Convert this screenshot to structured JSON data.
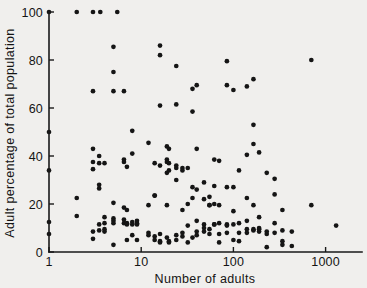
{
  "figure": {
    "background_color": "#f0efed",
    "ink_color": "#151515"
  },
  "axes": {
    "x_title": "Number of adults",
    "y_title": "Adult percentage of total population",
    "x_ticks": [
      "1",
      "10",
      "100",
      "1000"
    ],
    "y_ticks": [
      "0",
      "20",
      "40",
      "60",
      "80",
      "100"
    ]
  },
  "chart_data": {
    "type": "scatter",
    "title": "",
    "xlabel": "Number of adults",
    "ylabel": "Adult percentage of total population",
    "xscale": "log",
    "yscale": "linear",
    "xlim": [
      1,
      2200
    ],
    "ylim": [
      0,
      100
    ],
    "xticks": [
      1,
      10,
      100,
      1000
    ],
    "yticks": [
      0,
      20,
      40,
      60,
      80,
      100
    ],
    "grid": false,
    "legend": null,
    "marker": "filled-circle",
    "marker_color": "#151515",
    "points": [
      [
        1,
        100
      ],
      [
        2,
        100
      ],
      [
        3,
        100
      ],
      [
        3.6,
        100
      ],
      [
        5.5,
        100
      ],
      [
        1,
        50
      ],
      [
        1,
        34
      ],
      [
        1,
        12.5
      ],
      [
        1,
        7.5
      ],
      [
        2,
        22.5
      ],
      [
        2,
        15
      ],
      [
        3,
        67
      ],
      [
        3,
        43
      ],
      [
        3,
        37.5
      ],
      [
        3,
        34.5
      ],
      [
        3,
        8.5
      ],
      [
        3,
        5.5
      ],
      [
        3.5,
        40
      ],
      [
        3.5,
        37
      ],
      [
        3.5,
        28
      ],
      [
        3.5,
        26.5
      ],
      [
        3.5,
        11.5
      ],
      [
        3.5,
        9
      ],
      [
        4,
        37
      ],
      [
        4,
        14.5
      ],
      [
        4,
        12
      ],
      [
        4,
        9.5
      ],
      [
        4,
        8.5
      ],
      [
        5,
        85.5
      ],
      [
        5,
        75
      ],
      [
        5,
        67
      ],
      [
        5,
        20.5
      ],
      [
        5,
        14
      ],
      [
        5,
        13
      ],
      [
        5,
        12
      ],
      [
        5,
        3
      ],
      [
        6.5,
        67
      ],
      [
        6.5,
        38.5
      ],
      [
        6.5,
        37.5
      ],
      [
        6.5,
        18.5
      ],
      [
        6.5,
        13.5
      ],
      [
        6.5,
        12
      ],
      [
        7,
        35.5
      ],
      [
        7,
        17.5
      ],
      [
        7,
        12
      ],
      [
        7,
        11.5
      ],
      [
        7,
        5
      ],
      [
        8,
        50.5
      ],
      [
        8,
        41
      ],
      [
        8,
        12.5
      ],
      [
        8,
        11.5
      ],
      [
        8,
        7
      ],
      [
        9,
        13
      ],
      [
        9,
        12
      ],
      [
        9,
        11.5
      ],
      [
        9,
        5
      ],
      [
        12,
        45.5
      ],
      [
        12,
        19.5
      ],
      [
        12,
        8
      ],
      [
        12,
        7
      ],
      [
        14,
        37
      ],
      [
        14,
        23.5
      ],
      [
        14,
        23.5
      ],
      [
        14,
        6.5
      ],
      [
        14,
        5
      ],
      [
        16,
        86
      ],
      [
        16,
        82
      ],
      [
        16,
        61
      ],
      [
        16,
        36
      ],
      [
        16,
        7.5
      ],
      [
        16,
        4.5
      ],
      [
        16,
        4
      ],
      [
        19,
        44
      ],
      [
        19,
        38.5
      ],
      [
        19,
        37.5
      ],
      [
        19,
        33
      ],
      [
        19,
        19.5
      ],
      [
        19,
        6
      ],
      [
        20,
        43
      ],
      [
        20,
        37
      ],
      [
        20,
        34
      ],
      [
        20,
        4.5
      ],
      [
        20,
        4
      ],
      [
        24,
        77.5
      ],
      [
        24,
        61.5
      ],
      [
        24,
        36
      ],
      [
        24,
        35
      ],
      [
        24,
        30
      ],
      [
        24,
        7
      ],
      [
        24,
        5
      ],
      [
        28,
        35
      ],
      [
        28,
        34
      ],
      [
        28,
        17.5
      ],
      [
        28,
        8
      ],
      [
        28,
        6.5
      ],
      [
        32,
        35
      ],
      [
        32,
        20
      ],
      [
        32,
        11
      ],
      [
        32,
        4
      ],
      [
        36,
        68
      ],
      [
        36,
        58.5
      ],
      [
        36,
        27
      ],
      [
        36,
        22.5
      ],
      [
        36,
        6
      ],
      [
        40,
        69.5
      ],
      [
        40,
        43
      ],
      [
        40,
        26
      ],
      [
        40,
        13
      ],
      [
        40,
        8.5
      ],
      [
        40,
        7
      ],
      [
        48,
        29
      ],
      [
        48,
        22
      ],
      [
        48,
        11.5
      ],
      [
        48,
        10
      ],
      [
        48,
        8.5
      ],
      [
        55,
        23
      ],
      [
        55,
        19.5
      ],
      [
        55,
        19.5
      ],
      [
        55,
        9.5
      ],
      [
        55,
        7.5
      ],
      [
        62,
        38.5
      ],
      [
        62,
        27.5
      ],
      [
        62,
        20
      ],
      [
        62,
        11.5
      ],
      [
        62,
        11.5
      ],
      [
        70,
        38
      ],
      [
        70,
        19.5
      ],
      [
        70,
        12
      ],
      [
        70,
        7.5
      ],
      [
        70,
        4
      ],
      [
        85,
        79.5
      ],
      [
        85,
        69.5
      ],
      [
        85,
        27
      ],
      [
        85,
        11.5
      ],
      [
        85,
        11
      ],
      [
        85,
        8
      ],
      [
        100,
        67.5
      ],
      [
        100,
        27
      ],
      [
        100,
        17
      ],
      [
        100,
        11.5
      ],
      [
        100,
        5
      ],
      [
        115,
        34
      ],
      [
        115,
        12
      ],
      [
        115,
        8
      ],
      [
        115,
        4.5
      ],
      [
        140,
        69
      ],
      [
        140,
        40.5
      ],
      [
        140,
        22.5
      ],
      [
        140,
        13
      ],
      [
        140,
        9.5
      ],
      [
        140,
        8
      ],
      [
        165,
        72
      ],
      [
        165,
        53
      ],
      [
        165,
        45
      ],
      [
        165,
        19.5
      ],
      [
        165,
        9.5
      ],
      [
        165,
        9
      ],
      [
        190,
        41.5
      ],
      [
        190,
        14.5
      ],
      [
        190,
        10
      ],
      [
        190,
        9.5
      ],
      [
        190,
        8.5
      ],
      [
        230,
        33
      ],
      [
        230,
        8.5
      ],
      [
        230,
        7.5
      ],
      [
        230,
        2
      ],
      [
        280,
        30.5
      ],
      [
        280,
        24
      ],
      [
        280,
        12
      ],
      [
        280,
        8
      ],
      [
        340,
        17.5
      ],
      [
        340,
        9
      ],
      [
        340,
        4.5
      ],
      [
        340,
        3
      ],
      [
        430,
        8.5
      ],
      [
        430,
        2.5
      ],
      [
        700,
        80
      ],
      [
        700,
        19.5
      ],
      [
        1300,
        11
      ]
    ]
  }
}
